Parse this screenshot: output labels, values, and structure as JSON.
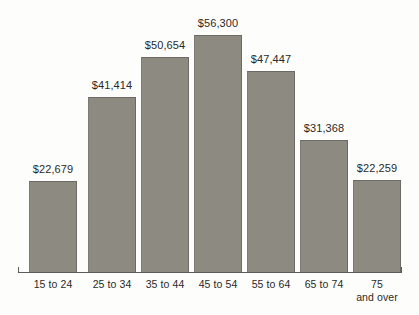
{
  "chart_data": {
    "type": "bar",
    "title": "",
    "xlabel": "",
    "ylabel": "",
    "categories": [
      "15 to 24",
      "25 to 34",
      "35 to 44",
      "45 to 54",
      "55 to 64",
      "65 to 74",
      "75\nand over"
    ],
    "values": [
      22679,
      41414,
      50654,
      56300,
      47447,
      31368,
      22259
    ],
    "value_labels": [
      "$22,679",
      "$41,414",
      "$50,654",
      "$56,300",
      "$47,447",
      "$31,368",
      "$22,259"
    ],
    "ylim": [
      0,
      56300
    ],
    "grid": false,
    "legend": null,
    "bar_color": "#8d8a82",
    "background_color": "#fdfdfc",
    "text_color": "#2a2a28",
    "axis_color": "#5e5c57"
  },
  "bars": [
    {
      "category": "15 to 24",
      "category_line1": "15 to 24",
      "category_line2": "",
      "value": 22679,
      "value_label": "$22,679",
      "left": 29,
      "width": 48,
      "top": 181,
      "height": 91,
      "label_left": 29,
      "label_top": 163,
      "cat_left": 24,
      "cat_top": 278
    },
    {
      "category": "25 to 34",
      "category_line1": "25 to 34",
      "category_line2": "",
      "value": 41414,
      "value_label": "$41,414",
      "left": 88,
      "width": 48,
      "top": 97,
      "height": 175,
      "label_left": 88,
      "label_top": 79,
      "cat_left": 83,
      "cat_top": 278
    },
    {
      "category": "35 to 44",
      "category_line1": "35 to 44",
      "category_line2": "",
      "value": 50654,
      "value_label": "$50,654",
      "left": 141,
      "width": 48,
      "top": 57,
      "height": 215,
      "label_left": 141,
      "label_top": 39,
      "cat_left": 136,
      "cat_top": 278
    },
    {
      "category": "45 to 54",
      "category_line1": "45 to 54",
      "category_line2": "",
      "value": 56300,
      "value_label": "$56,300",
      "left": 194,
      "width": 48,
      "top": 35,
      "height": 237,
      "label_left": 194,
      "label_top": 17,
      "cat_left": 189,
      "cat_top": 278
    },
    {
      "category": "55 to 64",
      "category_line1": "55 to 64",
      "category_line2": "",
      "value": 47447,
      "value_label": "$47,447",
      "left": 247,
      "width": 48,
      "top": 71,
      "height": 201,
      "label_left": 247,
      "label_top": 53,
      "cat_left": 242,
      "cat_top": 278
    },
    {
      "category": "65 to 74",
      "category_line1": "65 to 74",
      "category_line2": "",
      "value": 31368,
      "value_label": "$31,368",
      "left": 300,
      "width": 48,
      "top": 140,
      "height": 132,
      "label_left": 300,
      "label_top": 122,
      "cat_left": 295,
      "cat_top": 278
    },
    {
      "category": "75 and over",
      "category_line1": "75",
      "category_line2": "and over",
      "value": 22259,
      "value_label": "$22,259",
      "left": 353,
      "width": 48,
      "top": 180,
      "height": 92,
      "label_left": 353,
      "label_top": 162,
      "cat_left": 348,
      "cat_top": 278
    }
  ],
  "axis": {
    "baseline_y": 272,
    "left_x": 18,
    "right_x": 402
  }
}
